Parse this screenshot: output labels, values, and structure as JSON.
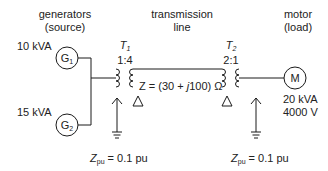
{
  "headers": {
    "generators": {
      "line1": "generators",
      "line2": "(source)"
    },
    "transmission": {
      "line1": "transmission",
      "line2": "line"
    },
    "motor": {
      "line1": "motor",
      "line2": "(load)"
    }
  },
  "generators": [
    {
      "id": "G1",
      "symbol": "G",
      "subscript": "1",
      "rating": "10 kVA"
    },
    {
      "id": "G2",
      "symbol": "G",
      "subscript": "2",
      "rating": "15 kVA"
    }
  ],
  "transformers": [
    {
      "id": "T1",
      "symbol": "T",
      "subscript": "1",
      "ratio": "1:4",
      "impedance_label": "Z",
      "impedance_sub": "pu",
      "impedance_value": "= 0.1 pu",
      "primary": "wye-grounded",
      "secondary": "delta"
    },
    {
      "id": "T2",
      "symbol": "T",
      "subscript": "2",
      "ratio": "2:1",
      "impedance_label": "Z",
      "impedance_sub": "pu",
      "impedance_value": "= 0.1 pu",
      "primary": "delta",
      "secondary": "wye-grounded"
    }
  ],
  "line": {
    "impedance_prefix": "Z = (30 + ",
    "impedance_j": "j",
    "impedance_suffix": "100) Ω"
  },
  "motor": {
    "symbol": "M",
    "rating": "20 kVA",
    "voltage": "4000 V"
  },
  "colors": {
    "stroke": "#1a1a1a",
    "text": "#222222",
    "background": "#ffffff"
  }
}
